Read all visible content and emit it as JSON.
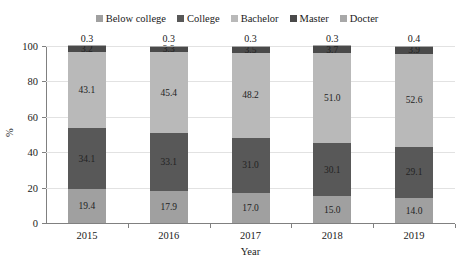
{
  "chart_data": {
    "type": "bar",
    "subtype": "stacked-percentage-column",
    "title": "",
    "xlabel": "Year",
    "ylabel": "%",
    "categories": [
      "2015",
      "2016",
      "2017",
      "2018",
      "2019"
    ],
    "ylim": [
      0,
      100
    ],
    "yticks": [
      0,
      20,
      40,
      60,
      80,
      100
    ],
    "ytick_labels": [
      "0",
      "20",
      "40",
      "60",
      "80",
      "100"
    ],
    "grid": "horizontal",
    "legend_position": "top-center",
    "stack_order_bottom_to_top": [
      "Below college",
      "College",
      "Bachelor",
      "Master",
      "Docter"
    ],
    "series": [
      {
        "name": "Below college",
        "color": "#a0a0a0",
        "values": [
          19.4,
          17.9,
          17.0,
          15.0,
          14.0
        ],
        "labels": [
          "19.4",
          "17.9",
          "17.0",
          "15.0",
          "14.0"
        ],
        "label_placement": "inside"
      },
      {
        "name": "College",
        "color": "#585858",
        "values": [
          34.1,
          33.1,
          31.0,
          30.1,
          29.1
        ],
        "labels": [
          "34.1",
          "33.1",
          "31.0",
          "30.1",
          "29.1"
        ],
        "label_placement": "inside"
      },
      {
        "name": "Bachelor",
        "color": "#b9b9b9",
        "values": [
          43.1,
          45.4,
          48.2,
          51.0,
          52.6
        ],
        "labels": [
          "43.1",
          "45.4",
          "48.2",
          "51.0",
          "52.6"
        ],
        "label_placement": "inside"
      },
      {
        "name": "Master",
        "color": "#4a4a4a",
        "values": [
          3.2,
          3.3,
          3.5,
          3.7,
          3.9
        ],
        "labels": [
          "3.2",
          "3.3",
          "3.5",
          "3.7",
          "3.9"
        ],
        "label_placement": "inside"
      },
      {
        "name": "Docter",
        "color": "#a8a8a8",
        "values": [
          0.3,
          0.3,
          0.3,
          0.3,
          0.4
        ],
        "labels": [
          "0.3",
          "0.3",
          "0.3",
          "0.3",
          "0.4"
        ],
        "label_placement": "above-bar"
      }
    ]
  },
  "legend": {
    "items": [
      {
        "label": "Below college",
        "color": "#a0a0a0"
      },
      {
        "label": "College",
        "color": "#585858"
      },
      {
        "label": "Bachelor",
        "color": "#b9b9b9"
      },
      {
        "label": "Master",
        "color": "#4a4a4a"
      },
      {
        "label": "Docter",
        "color": "#a8a8a8"
      }
    ]
  },
  "axes": {
    "y_title": "%",
    "x_title": "Year"
  },
  "colors": {
    "gridline": "#e2e2e2",
    "axis": "#808080",
    "text": "#1a1a1a",
    "background": "#ffffff"
  }
}
